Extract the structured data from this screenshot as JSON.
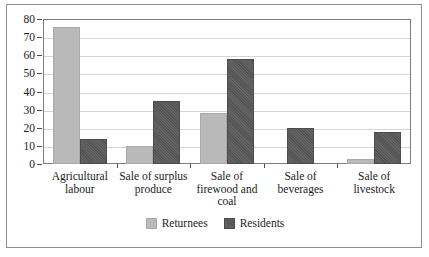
{
  "figure": {
    "caption_clipped": "",
    "frame_color": "#8e8e8e",
    "background": "#ffffff"
  },
  "chart_data": {
    "type": "bar",
    "title": "",
    "subtitle": "",
    "xlabel": "",
    "ylabel": "",
    "ylim": [
      0,
      80
    ],
    "ytick_values": [
      0,
      10,
      20,
      30,
      40,
      50,
      60,
      70,
      80
    ],
    "ytick_labels": [
      "0",
      "10",
      "20",
      "30",
      "40",
      "50",
      "60",
      "70",
      "80"
    ],
    "grid": "horizontal",
    "legend_position": "bottom-center",
    "categories": [
      "Agricultural labour",
      "Sale of surplus produce",
      "Sale of firewood and coal",
      "Sale of beverages",
      "Sale of livestock"
    ],
    "category_lines": [
      [
        "Agricultural",
        "labour"
      ],
      [
        "Sale of surplus",
        "produce"
      ],
      [
        "Sale of",
        "firewood and",
        "coal"
      ],
      [
        "Sale of",
        "beverages"
      ],
      [
        "Sale of",
        "livestock"
      ]
    ],
    "series": [
      {
        "name": "Returnees",
        "color": "#b9b9b9",
        "values": [
          75.5,
          10,
          28,
          0,
          3
        ]
      },
      {
        "name": "Residents",
        "color": "#585858",
        "values": [
          14,
          35,
          58,
          20,
          17.5
        ]
      }
    ]
  },
  "legend": {
    "items": [
      {
        "label": "Returnees",
        "swatch": "returnees"
      },
      {
        "label": "Residents",
        "swatch": "residents"
      }
    ]
  }
}
